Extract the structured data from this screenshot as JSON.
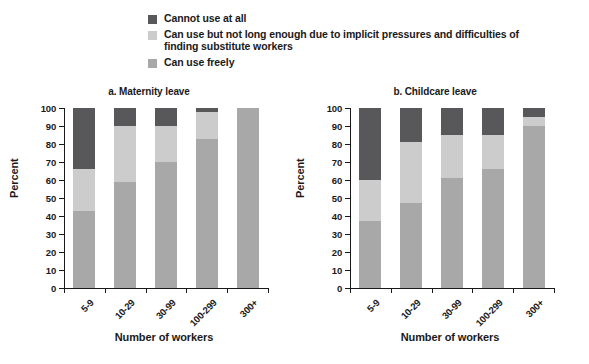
{
  "legend": {
    "items": [
      {
        "label": "Cannot use at all",
        "color": "#58585a",
        "key": "cannot_use"
      },
      {
        "label": "Can use but not long enough due to implicit pressures and difficulties of finding substitute workers",
        "color": "#cccccc",
        "key": "limited_use"
      },
      {
        "label": "Can use freely",
        "color": "#a8a8a8",
        "key": "free_use"
      }
    ]
  },
  "chart_data": {
    "type": "bar",
    "subtype": "stacked-bar-100",
    "title": "",
    "xlabel": "Number of workers",
    "ylabel": "Percent",
    "ylim": [
      0,
      100
    ],
    "yticks": [
      0,
      10,
      20,
      30,
      40,
      50,
      60,
      70,
      80,
      90,
      100
    ],
    "grid": false,
    "legend_position": "top",
    "categories": [
      "5-9",
      "10-29",
      "30-99",
      "100-299",
      "300+"
    ],
    "panels": [
      {
        "id": "a",
        "title": "a. Maternity leave",
        "series": [
          {
            "name": "Can use freely",
            "color": "#a8a8a8",
            "values": [
              43,
              59,
              70,
              83,
              100
            ]
          },
          {
            "name": "Can use but not long enough due to implicit pressures and difficulties of finding substitute workers",
            "color": "#cccccc",
            "values": [
              23,
              31,
              20,
              15,
              0
            ]
          },
          {
            "name": "Cannot use at all",
            "color": "#58585a",
            "values": [
              34,
              10,
              10,
              2,
              0
            ]
          }
        ]
      },
      {
        "id": "b",
        "title": "b. Childcare leave",
        "series": [
          {
            "name": "Can use freely",
            "color": "#a8a8a8",
            "values": [
              37,
              47,
              61,
              66,
              90
            ]
          },
          {
            "name": "Can use but not long enough due to implicit pressures and difficulties of finding substitute workers",
            "color": "#cccccc",
            "values": [
              23,
              34,
              24,
              19,
              5
            ]
          },
          {
            "name": "Cannot use at all",
            "color": "#58585a",
            "values": [
              40,
              19,
              15,
              15,
              5
            ]
          }
        ]
      }
    ]
  }
}
